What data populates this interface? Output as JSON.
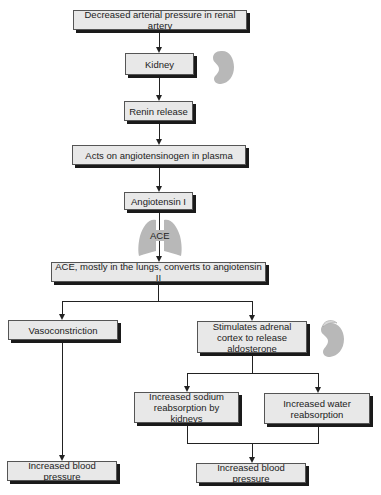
{
  "diagram": {
    "nodes": [
      {
        "id": "n1",
        "label": "Decreased arterial pressure in renal artery"
      },
      {
        "id": "n2",
        "label": "Kidney"
      },
      {
        "id": "n3",
        "label": "Renin release"
      },
      {
        "id": "n4",
        "label": "Acts on angiotensinogen in plasma"
      },
      {
        "id": "n5",
        "label": "Angiotensin I"
      },
      {
        "id": "n6",
        "label": "ACE, mostly in the lungs, converts to angiotensin II"
      },
      {
        "id": "n7",
        "label": "Vasoconstriction"
      },
      {
        "id": "n8",
        "label": "Stimulates adrenal cortex to release aldosterone"
      },
      {
        "id": "n9",
        "label": "Increased sodium reabsorption by kidneys"
      },
      {
        "id": "n10",
        "label": "Increased water reabsorption"
      },
      {
        "id": "n11",
        "label": "Increased blood pressure"
      },
      {
        "id": "n12",
        "label": "Increased blood pressure"
      }
    ],
    "edge_label_ace": "ACE",
    "edges": [
      [
        "n1",
        "n2"
      ],
      [
        "n2",
        "n3"
      ],
      [
        "n3",
        "n4"
      ],
      [
        "n4",
        "n5"
      ],
      [
        "n5",
        "n6"
      ],
      [
        "n6",
        "n7"
      ],
      [
        "n6",
        "n8"
      ],
      [
        "n7",
        "n11"
      ],
      [
        "n8",
        "n9"
      ],
      [
        "n8",
        "n10"
      ],
      [
        "n9",
        "n12"
      ],
      [
        "n10",
        "n12"
      ]
    ],
    "icons": {
      "kidney": "kidney-icon",
      "lungs": "lungs-icon",
      "adrenal": "adrenal-kidney-icon"
    },
    "colors": {
      "box_fill": "#e8e8e8",
      "box_border": "#555555",
      "shadow": "#1a1a1a",
      "organ": "#b8b8b8"
    }
  }
}
